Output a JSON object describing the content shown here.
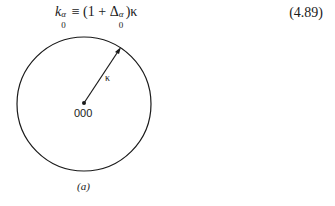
{
  "equation": {
    "lhs_symbol": "k",
    "lhs_superscript": "α",
    "lhs_subscript": "0",
    "relation": " ≡ (1 + Δ",
    "delta_superscript": "α",
    "delta_subscript": "0",
    "rhs_tail": ")κ",
    "number": "(4.89)"
  },
  "figure": {
    "radius_label": "κ",
    "center_label": "000",
    "caption": "(a)",
    "stroke_color": "#1a1a1a"
  }
}
